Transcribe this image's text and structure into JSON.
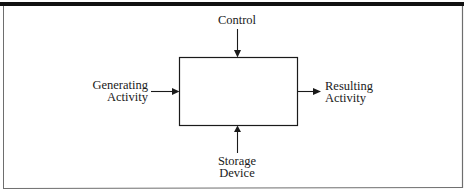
{
  "diagram": {
    "type": "process-block-diagram",
    "process_box": {
      "label": ""
    },
    "inputs": {
      "top": {
        "lines": [
          "Control"
        ]
      },
      "left": {
        "lines": [
          "Generating",
          "Activity"
        ]
      },
      "bottom": {
        "lines": [
          "Storage",
          "Device"
        ]
      }
    },
    "outputs": {
      "right": {
        "lines": [
          "Resulting",
          "Activity"
        ]
      }
    },
    "colors": {
      "stroke": "#1a1a1a",
      "frame": "#6e6e6e",
      "top_bar": "#111111",
      "background": "#ffffff"
    }
  }
}
